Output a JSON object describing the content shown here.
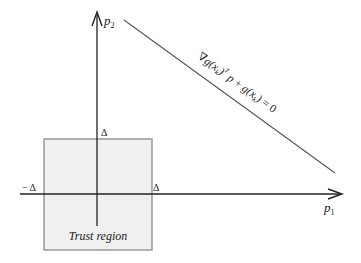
{
  "diagram": {
    "axes": {
      "x_label": "p",
      "x_label_sub": "1",
      "y_label": "p",
      "y_label_sub": "2",
      "color": "#222222"
    },
    "ticks": {
      "top": "Δ",
      "right": "Δ",
      "left": "− Δ"
    },
    "trust_region": {
      "label": "Trust region",
      "fill": "#f0f0f0",
      "stroke": "#8a8a8a"
    },
    "constraint_line": {
      "color": "#555555",
      "equation": {
        "nabla": "∇",
        "g1": "g(",
        "x1": "x",
        "k1": "k",
        "close1": ")",
        "transpose": "T",
        "p": " p",
        "plus": " + ",
        "g2": "g(",
        "x2": "x",
        "k2": "k",
        "close2": ")",
        "equals": " = 0"
      }
    }
  }
}
